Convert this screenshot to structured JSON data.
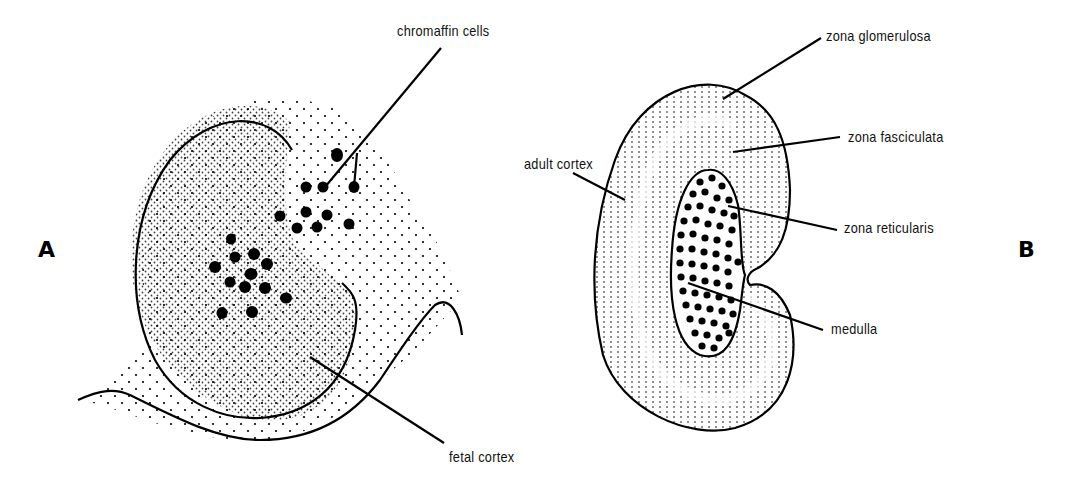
{
  "figure": {
    "panels": [
      {
        "id": "A",
        "letter": "A",
        "description": "Fetal adrenal gland",
        "labels": {
          "chromaffin": "chromaffin cells",
          "fetal_cortex": "fetal cortex"
        }
      },
      {
        "id": "B",
        "letter": "B",
        "description": "Adult adrenal gland",
        "labels": {
          "zona_glomerulosa": "zona glomerulosa",
          "zona_fasciculata": "zona fasciculata",
          "adult_cortex": "adult cortex",
          "zona_reticularis": "zona reticularis",
          "medulla": "medulla"
        }
      }
    ],
    "colors": {
      "ink": "#000000",
      "background": "#ffffff"
    }
  }
}
